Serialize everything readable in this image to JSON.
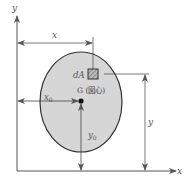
{
  "diagram": {
    "axes": {
      "x_label": "x",
      "y_label": "y"
    },
    "dimensions": {
      "x": "x",
      "y": "y",
      "x0": "x",
      "x0_sub": "0",
      "y0": "y",
      "y0_sub": "0"
    },
    "element": {
      "label": "dA"
    },
    "centroid": {
      "label": "G (図心)"
    },
    "colors": {
      "shape_fill": "#d6d6d6",
      "shape_stroke": "#333333",
      "line": "#555555",
      "element_fill": "#9a9a9a"
    }
  }
}
